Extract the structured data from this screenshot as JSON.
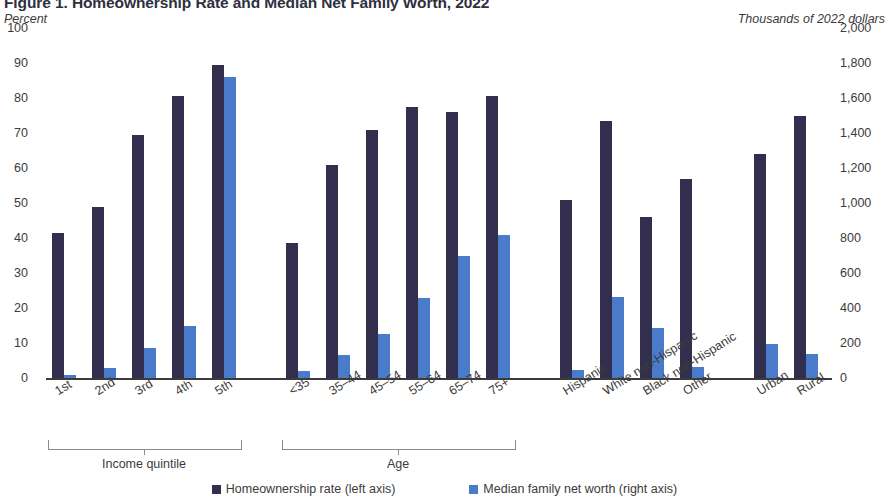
{
  "title": "Figure 1. Homeownership Rate and Median Net Family Worth, 2022",
  "left_axis_caption": "Percent",
  "right_axis_caption": "Thousands of 2022 dollars",
  "legend": {
    "rate_label": "Homeownership rate (left axis)",
    "worth_label": "Median family net worth (right axis)",
    "rate_color": "#322F4E",
    "worth_color": "#4A7BCB"
  },
  "groups": [
    {
      "label": "Income quintile",
      "bracket": true
    },
    {
      "label": "Age",
      "bracket": true
    },
    {
      "label": "",
      "bracket": false
    },
    {
      "label": "",
      "bracket": false
    }
  ],
  "chart_data": {
    "type": "bar",
    "title": "Figure 1. Homeownership Rate and Median Net Family Worth, 2022",
    "xlabel": "",
    "ylabel": "Percent",
    "y2label": "Thousands of 2022 dollars",
    "ylim": [
      0,
      100
    ],
    "y2lim": [
      0,
      2000
    ],
    "yticks": [
      "0",
      "10",
      "20",
      "30",
      "40",
      "50",
      "60",
      "70",
      "80",
      "90",
      "100"
    ],
    "y2ticks": [
      "0",
      "200",
      "400",
      "600",
      "800",
      "1,000",
      "1,200",
      "1,400",
      "1,600",
      "1,800",
      "2,000"
    ],
    "grid": false,
    "legend_position": "bottom",
    "categories": [
      "1st",
      "2nd",
      "3rd",
      "4th",
      "5th",
      "<35",
      "35–44",
      "45–54",
      "55–64",
      "65–74",
      "75+",
      "Hispanic",
      "White non-Hispanic",
      "Black non-Hispanic",
      "Other",
      "Urban",
      "Rural"
    ],
    "group_of": [
      "Income quintile",
      "Income quintile",
      "Income quintile",
      "Income quintile",
      "Income quintile",
      "Age",
      "Age",
      "Age",
      "Age",
      "Age",
      "Age",
      "Race/ethnicity",
      "Race/ethnicity",
      "Race/ethnicity",
      "Race/ethnicity",
      "Location",
      "Location"
    ],
    "series": [
      {
        "name": "Homeownership rate (left axis)",
        "axis": "left",
        "units": "percent",
        "color": "#322F4E",
        "values": [
          41.5,
          49,
          69.5,
          80.5,
          89.5,
          38.5,
          61,
          71,
          77.5,
          76,
          80.5,
          51,
          73.5,
          46,
          57,
          64,
          75
        ]
      },
      {
        "name": "Median family net worth (right axis)",
        "axis": "right",
        "units": "thousands of 2022 dollars",
        "color": "#4A7BCB",
        "values": [
          20,
          60,
          170,
          300,
          1720,
          40,
          130,
          250,
          460,
          700,
          1000,
          1000,
          1000,
          1000,
          1000,
          1000,
          1000
        ]
      }
    ]
  },
  "right_values_override": [
    20,
    60,
    170,
    300,
    1720,
    40,
    130,
    250,
    460,
    700,
    1000
  ],
  "bars": [
    {
      "cat": "1st",
      "group": 0,
      "rate": 41.5,
      "worth": 20
    },
    {
      "cat": "2nd",
      "group": 0,
      "rate": 49,
      "worth": 60
    },
    {
      "cat": "3rd",
      "group": 0,
      "rate": 69.5,
      "worth": 170
    },
    {
      "cat": "4th",
      "group": 0,
      "rate": 80.5,
      "worth": 300
    },
    {
      "cat": "5th",
      "group": 0,
      "rate": 89.5,
      "worth": 1720
    },
    {
      "cat": "<35",
      "group": 1,
      "rate": 38.5,
      "worth": 40
    },
    {
      "cat": "35–44",
      "group": 1,
      "rate": 61,
      "worth": 130
    },
    {
      "cat": "45–54",
      "group": 1,
      "rate": 71,
      "worth": 250
    },
    {
      "cat": "55–64",
      "group": 1,
      "rate": 77.5,
      "worth": 460
    },
    {
      "cat": "65–74",
      "group": 1,
      "rate": 76,
      "worth": 700
    },
    {
      "cat": "75+",
      "group": 1,
      "rate": 80.5,
      "worth": 820
    },
    {
      "cat": "Hispanic",
      "group": 2,
      "rate": 51,
      "worth": 45
    },
    {
      "cat": "White non-Hispanic",
      "group": 2,
      "rate": 73.5,
      "worth": 465
    },
    {
      "cat": "Black non-Hispanic",
      "group": 2,
      "rate": 46,
      "worth": 285
    },
    {
      "cat": "Other",
      "group": 2,
      "rate": 57,
      "worth": 65
    },
    {
      "cat": "Urban",
      "group": 3,
      "rate": 64,
      "worth": 195
    },
    {
      "cat": "Rural",
      "group": 3,
      "rate": 75,
      "worth": 140
    }
  ]
}
